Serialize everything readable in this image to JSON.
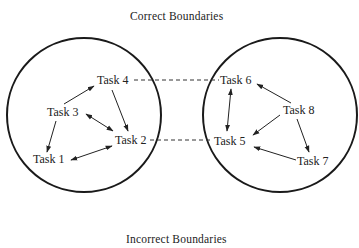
{
  "titles": {
    "top": "Correct Boundaries",
    "bottom": "Incorrect Boundaries"
  },
  "boundaries": [
    {
      "name": "left-boundary",
      "cx": 84,
      "cy": 115,
      "r": 77
    },
    {
      "name": "right-boundary",
      "cx": 280,
      "cy": 115,
      "r": 77
    }
  ],
  "tasks": [
    {
      "id": "task1",
      "label": "Task 1",
      "x": 33,
      "y": 163
    },
    {
      "id": "task2",
      "label": "Task 2",
      "x": 115,
      "y": 144
    },
    {
      "id": "task3",
      "label": "Task 3",
      "x": 47,
      "y": 116
    },
    {
      "id": "task4",
      "label": "Task 4",
      "x": 97,
      "y": 84
    },
    {
      "id": "task5",
      "label": "Task 5",
      "x": 214,
      "y": 145
    },
    {
      "id": "task6",
      "label": "Task 6",
      "x": 220,
      "y": 84
    },
    {
      "id": "task7",
      "label": "Task 7",
      "x": 297,
      "y": 165
    },
    {
      "id": "task8",
      "label": "Task 8",
      "x": 283,
      "y": 114
    }
  ],
  "edges": [
    {
      "from": "Task 3",
      "to": "Task 4",
      "type": "arrow",
      "bidirectional": false
    },
    {
      "from": "Task 4",
      "to": "Task 2",
      "type": "arrow",
      "bidirectional": false
    },
    {
      "from": "Task 3",
      "to": "Task 2",
      "type": "arrow",
      "bidirectional": true
    },
    {
      "from": "Task 3",
      "to": "Task 1",
      "type": "arrow",
      "bidirectional": false
    },
    {
      "from": "Task 1",
      "to": "Task 2",
      "type": "arrow",
      "bidirectional": true
    },
    {
      "from": "Task 6",
      "to": "Task 5",
      "type": "arrow",
      "bidirectional": true
    },
    {
      "from": "Task 8",
      "to": "Task 6",
      "type": "arrow",
      "bidirectional": false
    },
    {
      "from": "Task 8",
      "to": "Task 5",
      "type": "arrow",
      "bidirectional": false
    },
    {
      "from": "Task 8",
      "to": "Task 7",
      "type": "arrow",
      "bidirectional": false
    },
    {
      "from": "Task 7",
      "to": "Task 5",
      "type": "arrow",
      "bidirectional": false
    },
    {
      "from": "Task 4",
      "to": "Task 6",
      "type": "dashed"
    },
    {
      "from": "Task 2",
      "to": "Task 5",
      "type": "dashed"
    }
  ]
}
